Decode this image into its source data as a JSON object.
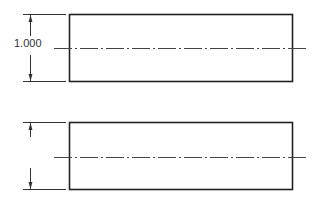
{
  "views": [
    {
      "name": "top-view",
      "dimension_label": "1.000",
      "dimension_shown": true
    },
    {
      "name": "bottom-view",
      "dimension_label": "",
      "dimension_shown": false
    }
  ],
  "colors": {
    "outline": "#222222",
    "centerline": "#444444",
    "dimension": "#333333"
  }
}
